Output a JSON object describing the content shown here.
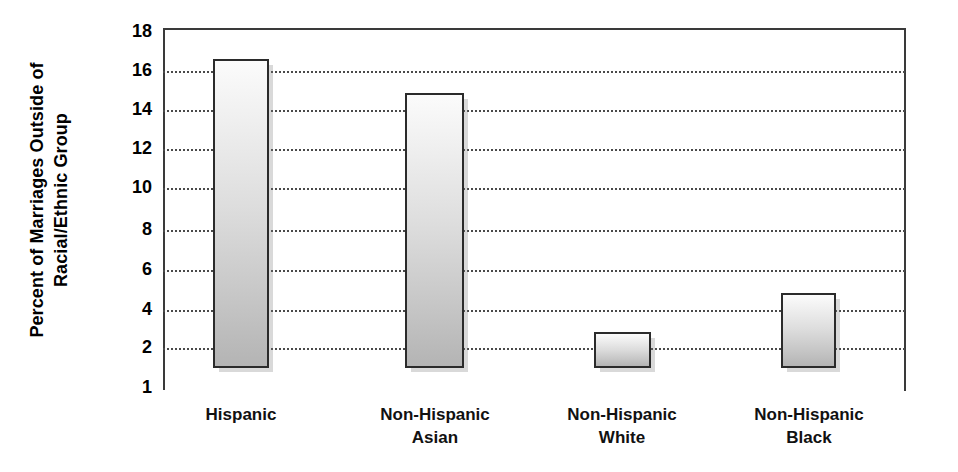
{
  "chart_data": {
    "type": "bar",
    "title": "",
    "xlabel": "",
    "ylabel": "Percent of Marriages Outside of\nRacial/Ethnic Group",
    "categories": [
      "Hispanic",
      "Non-Hispanic\nAsian",
      "Non-Hispanic\nWhite",
      "Non-Hispanic\nBlack"
    ],
    "values": [
      16.6,
      14.9,
      2.8,
      4.8
    ],
    "ylim": [
      1,
      18
    ],
    "yticks": [
      18,
      16,
      14,
      12,
      10,
      8,
      6,
      4,
      2,
      1
    ],
    "ytick_labels": [
      "18",
      "16",
      "14",
      "12",
      "10",
      "8",
      "6",
      "4",
      "2",
      "1"
    ],
    "gridlines": [
      16,
      14,
      12,
      10,
      8,
      6,
      4,
      2
    ],
    "grid": true,
    "legend": null,
    "colors": {
      "bar_fill_top": "#fbfbfb",
      "bar_fill_bottom": "#b4b4b4",
      "bar_border": "#2b2b2b",
      "grid": "#4a4a4a",
      "axis": "#3a3a3a",
      "text": "#000000",
      "background": "#ffffff"
    }
  },
  "axis": {
    "y_title_line1": "Percent of Marriages Outside of",
    "y_title_line2": "Racial/Ethnic Group",
    "ticks": [
      {
        "label": "18"
      },
      {
        "label": "16"
      },
      {
        "label": "14"
      },
      {
        "label": "12"
      },
      {
        "label": "10"
      },
      {
        "label": "8"
      },
      {
        "label": "6"
      },
      {
        "label": "4"
      },
      {
        "label": "2"
      },
      {
        "label": "1"
      }
    ]
  },
  "bars": [
    {
      "label": "Hispanic",
      "value": 16.6
    },
    {
      "label": "Non-Hispanic\nAsian",
      "value": 14.9
    },
    {
      "label": "Non-Hispanic\nWhite",
      "value": 2.8
    },
    {
      "label": "Non-Hispanic\nBlack",
      "value": 4.8
    }
  ]
}
